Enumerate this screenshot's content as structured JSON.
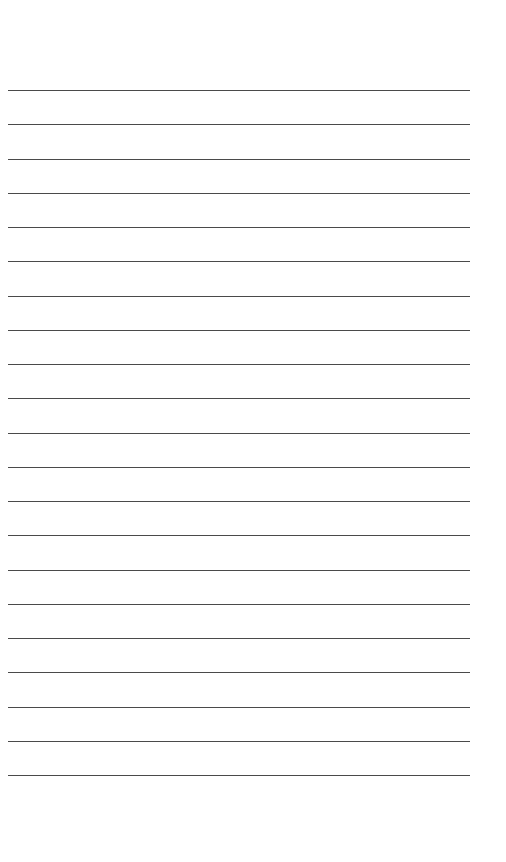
{
  "page": {
    "type": "lined-paper",
    "background": "#ffffff",
    "line_color": "#4a4a4a",
    "line_count": 21,
    "first_line_y": 90,
    "line_spacing": 34.25,
    "line_left": 8,
    "line_width": 462
  }
}
